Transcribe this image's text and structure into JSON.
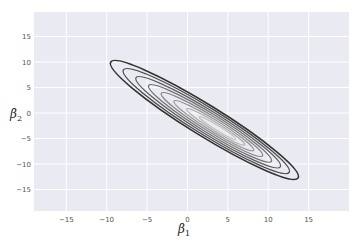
{
  "chart_data": {
    "type": "contour",
    "title": "",
    "xlabel": "β1",
    "ylabel": "β2",
    "xlabel_parts": {
      "base": "β",
      "sub": "1"
    },
    "ylabel_parts": {
      "base": "β",
      "sub": "2"
    },
    "xlim": [
      -19,
      20
    ],
    "ylim": [
      -19.2,
      19.8
    ],
    "xticks": [
      -15,
      -10,
      -5,
      0,
      5,
      10,
      15
    ],
    "yticks": [
      15,
      10,
      5,
      0,
      -5,
      -10,
      -15
    ],
    "xtick_labels": [
      "−15",
      "−10",
      "−5",
      "0",
      "5",
      "10",
      "15"
    ],
    "ytick_labels": [
      "15",
      "10",
      "5",
      "0",
      "−5",
      "−10",
      "−15"
    ],
    "grid": true,
    "legend": null,
    "style": {
      "background": "#EAEAF2",
      "grid_color": "#FFFFFF"
    },
    "distribution": {
      "center": [
        2.1,
        -1.4
      ],
      "correlation": "strongly negative",
      "outer_contour_extent": {
        "upper_left_tip": [
          -9.5,
          10
        ],
        "lower_right_tip": [
          13.7,
          -12.7
        ]
      }
    },
    "contour_levels": 8,
    "contour_colors": [
      "#333333",
      "#4a4a4a",
      "#5e5e5e",
      "#727272",
      "#868686",
      "#9a9a9a",
      "#aeaeae",
      "#c4c4c4"
    ]
  }
}
